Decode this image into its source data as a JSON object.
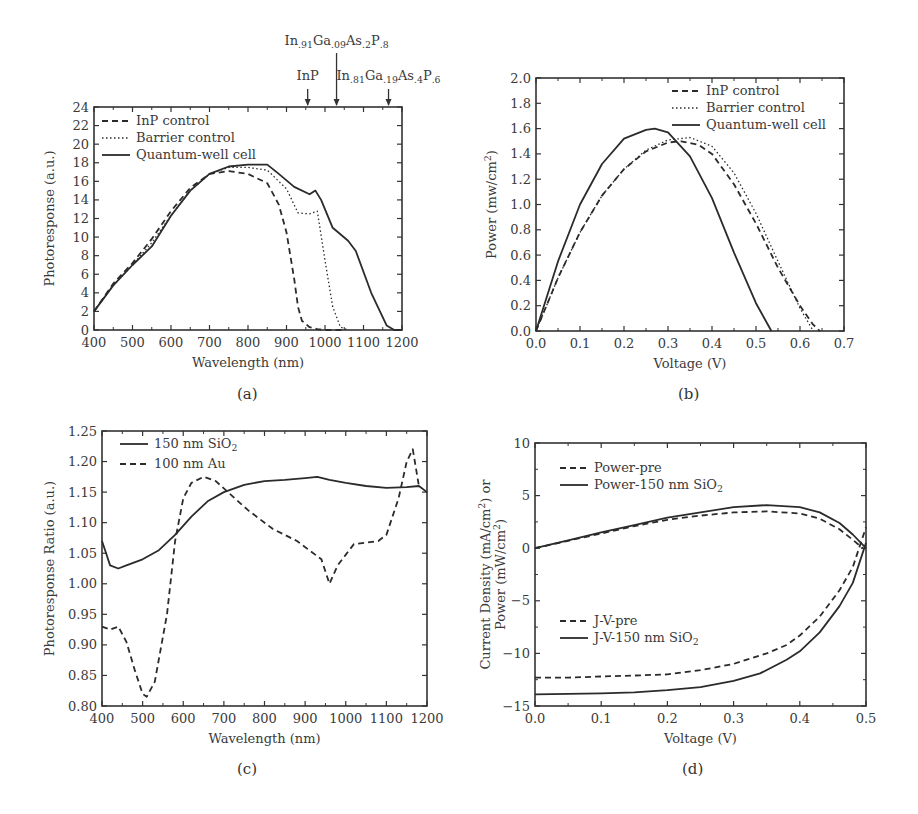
{
  "figure": {
    "panel_labels": [
      "(a)",
      "(b)",
      "(c)",
      "(d)"
    ]
  },
  "chart_data": [
    {
      "id": "a",
      "type": "line",
      "title": "",
      "xlabel": "Wavelength (nm)",
      "ylabel": "Photoresponse (a.u.)",
      "xlim": [
        400,
        1200
      ],
      "ylim": [
        0,
        24
      ],
      "xticks": [
        400,
        500,
        600,
        700,
        800,
        900,
        1000,
        1100,
        1200
      ],
      "yticks": [
        0,
        2,
        4,
        6,
        8,
        10,
        12,
        14,
        16,
        18,
        20,
        22,
        24
      ],
      "grid": false,
      "legend_position": "upper-left",
      "box": {
        "x0": 94,
        "y0": 107,
        "x1": 402,
        "y1": 330
      },
      "annotations": [
        {
          "text": "InP",
          "x_value": 955,
          "level": "low"
        },
        {
          "text": "In.91Ga.09As.2P.8",
          "x_value": 1030,
          "level": "high"
        },
        {
          "text": "In.81Ga.19As.4P.6",
          "x_value": 1165,
          "level": "low"
        }
      ],
      "series": [
        {
          "name": "InP control",
          "style": "dashed",
          "x": [
            400,
            450,
            500,
            550,
            600,
            650,
            700,
            750,
            800,
            850,
            880,
            900,
            920,
            930,
            940,
            960,
            980,
            1000,
            1050
          ],
          "y": [
            2.0,
            5.0,
            7.2,
            9.8,
            12.8,
            15.3,
            16.8,
            17.1,
            16.8,
            15.8,
            13.5,
            10.5,
            5.5,
            2.5,
            1.0,
            0.3,
            0.1,
            0.0,
            0.0
          ]
        },
        {
          "name": "Barrier control",
          "style": "dotted",
          "x": [
            400,
            450,
            500,
            550,
            600,
            650,
            700,
            750,
            800,
            850,
            900,
            930,
            960,
            980,
            1000,
            1020,
            1040,
            1060
          ],
          "y": [
            2.0,
            4.8,
            7.0,
            9.4,
            12.3,
            15.0,
            16.8,
            17.5,
            17.5,
            17.2,
            15.2,
            12.6,
            12.5,
            12.8,
            7.5,
            2.5,
            0.3,
            0.0
          ]
        },
        {
          "name": "Quantum-well cell",
          "style": "solid",
          "x": [
            400,
            450,
            500,
            550,
            600,
            650,
            700,
            750,
            800,
            850,
            880,
            920,
            960,
            975,
            990,
            1020,
            1060,
            1080,
            1120,
            1160,
            1180,
            1200
          ],
          "y": [
            2.0,
            4.8,
            7.0,
            9.0,
            12.3,
            15.0,
            16.8,
            17.6,
            17.8,
            17.8,
            16.8,
            15.4,
            14.6,
            15.0,
            14.0,
            11.0,
            9.6,
            8.5,
            4.0,
            0.5,
            0.0,
            0.0
          ]
        }
      ]
    },
    {
      "id": "b",
      "type": "line",
      "title": "",
      "xlabel": "Voltage (V)",
      "ylabel": "Power (mw/cm2)",
      "xlim": [
        0.0,
        0.7
      ],
      "ylim": [
        0.0,
        2.0
      ],
      "xticks": [
        0.0,
        0.1,
        0.2,
        0.3,
        0.4,
        0.5,
        0.6,
        0.7
      ],
      "yticks": [
        0.0,
        0.2,
        0.4,
        0.6,
        0.8,
        1.0,
        1.2,
        1.4,
        1.6,
        1.8,
        2.0
      ],
      "grid": false,
      "legend_position": "upper-right",
      "box": {
        "x0": 536,
        "y0": 78,
        "x1": 844,
        "y1": 331
      },
      "series": [
        {
          "name": "InP control",
          "style": "dashed",
          "x": [
            0.0,
            0.05,
            0.1,
            0.15,
            0.2,
            0.25,
            0.3,
            0.33,
            0.37,
            0.4,
            0.45,
            0.5,
            0.55,
            0.6,
            0.63,
            0.645
          ],
          "y": [
            0.0,
            0.42,
            0.78,
            1.07,
            1.28,
            1.42,
            1.49,
            1.5,
            1.47,
            1.4,
            1.16,
            0.85,
            0.5,
            0.2,
            0.05,
            0.0
          ]
        },
        {
          "name": "Barrier control",
          "style": "dotted",
          "x": [
            0.0,
            0.05,
            0.1,
            0.15,
            0.2,
            0.25,
            0.3,
            0.35,
            0.4,
            0.45,
            0.5,
            0.55,
            0.6,
            0.63
          ],
          "y": [
            0.0,
            0.42,
            0.78,
            1.07,
            1.28,
            1.43,
            1.51,
            1.53,
            1.46,
            1.25,
            0.93,
            0.55,
            0.18,
            0.0
          ]
        },
        {
          "name": "Quantum-well cell",
          "style": "solid",
          "x": [
            0.0,
            0.05,
            0.1,
            0.15,
            0.2,
            0.25,
            0.27,
            0.3,
            0.35,
            0.4,
            0.45,
            0.5,
            0.535
          ],
          "y": [
            0.0,
            0.55,
            1.0,
            1.32,
            1.52,
            1.59,
            1.6,
            1.57,
            1.38,
            1.05,
            0.62,
            0.22,
            0.0
          ]
        }
      ]
    },
    {
      "id": "c",
      "type": "line",
      "title": "",
      "xlabel": "Wavelength (nm)",
      "ylabel": "Photoresponse Ratio (a.u.)",
      "xlim": [
        400,
        1200
      ],
      "ylim": [
        0.8,
        1.25
      ],
      "xticks": [
        400,
        500,
        600,
        700,
        800,
        900,
        1000,
        1100,
        1200
      ],
      "yticks": [
        0.8,
        0.85,
        0.9,
        0.95,
        1.0,
        1.05,
        1.1,
        1.15,
        1.2,
        1.25
      ],
      "grid": false,
      "legend_position": "upper-left",
      "box": {
        "x0": 102,
        "y0": 431,
        "x1": 427,
        "y1": 706
      },
      "series": [
        {
          "name": "150 nm SiO2",
          "style": "solid",
          "x": [
            400,
            410,
            420,
            440,
            460,
            500,
            540,
            580,
            620,
            660,
            700,
            750,
            800,
            850,
            900,
            930,
            960,
            1000,
            1050,
            1100,
            1150,
            1180,
            1200
          ],
          "y": [
            1.07,
            1.05,
            1.03,
            1.025,
            1.03,
            1.04,
            1.055,
            1.08,
            1.11,
            1.135,
            1.15,
            1.162,
            1.168,
            1.17,
            1.173,
            1.175,
            1.17,
            1.165,
            1.16,
            1.157,
            1.158,
            1.16,
            1.15
          ]
        },
        {
          "name": "100 nm Au",
          "style": "dashed",
          "x": [
            400,
            420,
            440,
            460,
            480,
            500,
            510,
            530,
            560,
            580,
            600,
            620,
            650,
            680,
            710,
            760,
            820,
            880,
            940,
            960,
            980,
            1020,
            1080,
            1100,
            1130,
            1150,
            1165,
            1180
          ],
          "y": [
            0.93,
            0.925,
            0.93,
            0.905,
            0.86,
            0.82,
            0.815,
            0.84,
            0.95,
            1.07,
            1.14,
            1.165,
            1.175,
            1.168,
            1.15,
            1.12,
            1.09,
            1.07,
            1.04,
            1.0,
            1.03,
            1.065,
            1.07,
            1.08,
            1.14,
            1.2,
            1.22,
            1.16
          ]
        }
      ]
    },
    {
      "id": "d",
      "type": "line",
      "title": "",
      "xlabel": "Voltage (V)",
      "ylabel": "Current Density (mA/cm2) or Power (mW/cm2)",
      "xlim": [
        0.0,
        0.5
      ],
      "ylim": [
        -15,
        10
      ],
      "xticks": [
        0.0,
        0.1,
        0.2,
        0.3,
        0.4,
        0.5
      ],
      "yticks": [
        -15,
        -10,
        -5,
        0,
        5,
        10
      ],
      "grid": false,
      "legend_position": "upper-left / lower-left",
      "box": {
        "x0": 535,
        "y0": 443,
        "x1": 866,
        "y1": 706
      },
      "series": [
        {
          "name": "Power-pre",
          "style": "dashed",
          "x": [
            0.0,
            0.05,
            0.1,
            0.15,
            0.2,
            0.25,
            0.3,
            0.35,
            0.4,
            0.43,
            0.46,
            0.48,
            0.495
          ],
          "y": [
            0.0,
            0.7,
            1.4,
            2.1,
            2.7,
            3.1,
            3.4,
            3.5,
            3.3,
            2.8,
            1.8,
            0.8,
            0.0
          ]
        },
        {
          "name": "Power-150 nm SiO2",
          "style": "solid",
          "x": [
            0.0,
            0.05,
            0.1,
            0.15,
            0.2,
            0.25,
            0.3,
            0.35,
            0.4,
            0.43,
            0.46,
            0.48,
            0.5
          ],
          "y": [
            0.0,
            0.75,
            1.5,
            2.2,
            2.9,
            3.4,
            3.9,
            4.1,
            3.9,
            3.4,
            2.4,
            1.3,
            0.0
          ]
        },
        {
          "name": "J-V-pre",
          "style": "dashed",
          "x": [
            0.0,
            0.05,
            0.1,
            0.15,
            0.2,
            0.25,
            0.3,
            0.35,
            0.38,
            0.4,
            0.43,
            0.46,
            0.48,
            0.5
          ],
          "y": [
            -12.3,
            -12.3,
            -12.2,
            -12.1,
            -12.0,
            -11.6,
            -11.0,
            -10.0,
            -9.2,
            -8.3,
            -6.5,
            -4.0,
            -1.8,
            2.0
          ]
        },
        {
          "name": "J-V-150 nm SiO2",
          "style": "solid",
          "x": [
            0.0,
            0.05,
            0.1,
            0.15,
            0.2,
            0.25,
            0.3,
            0.34,
            0.38,
            0.4,
            0.43,
            0.46,
            0.48,
            0.5
          ],
          "y": [
            -13.9,
            -13.85,
            -13.8,
            -13.7,
            -13.5,
            -13.2,
            -12.6,
            -11.9,
            -10.6,
            -9.8,
            -8.0,
            -5.5,
            -3.3,
            0.5
          ]
        }
      ]
    }
  ]
}
